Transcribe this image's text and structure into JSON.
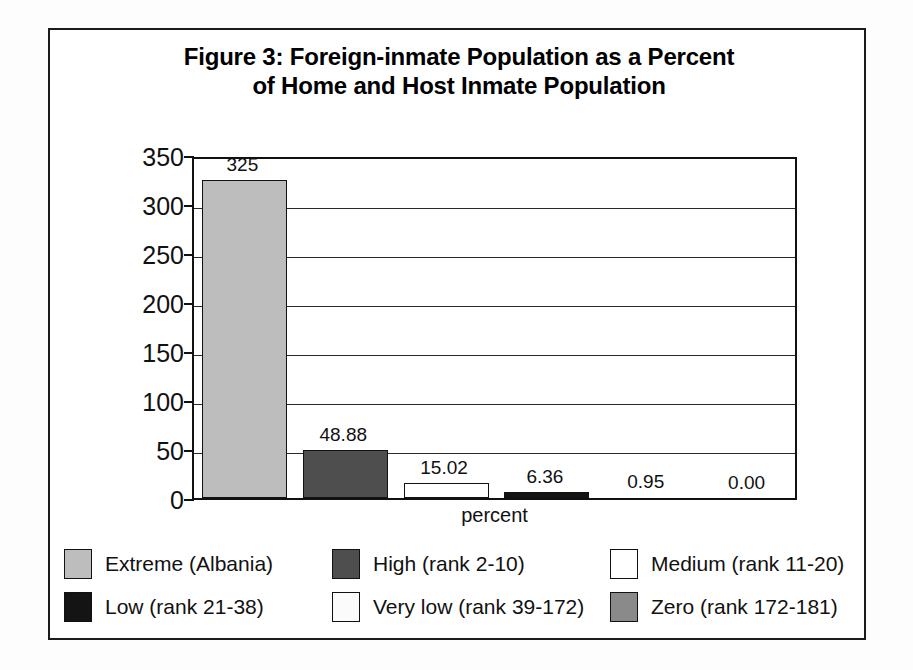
{
  "figure": {
    "title_line1": "Figure 3: Foreign-inmate Population as a Percent",
    "title_line2": "of Home and Host Inmate Population",
    "border_color": "#1b1b1b"
  },
  "chart_data": {
    "type": "bar",
    "title": "Figure 3: Foreign-inmate Population as a Percent of Home and Host Inmate Population",
    "xlabel": "percent",
    "ylabel": "",
    "ylim": [
      0,
      350
    ],
    "yticks": [
      0,
      50,
      100,
      150,
      200,
      250,
      300,
      350
    ],
    "grid": true,
    "legend_position": "bottom",
    "categories": [
      "Extreme (Albania)",
      "High (rank 2-10)",
      "Medium (rank 11-20)",
      "Low (rank 21-38)",
      "Very low (rank 39-172)",
      "Zero (rank 172-181)"
    ],
    "values": [
      325,
      48.88,
      15.02,
      6.36,
      0.95,
      0.0
    ],
    "data_labels": [
      "325",
      "48.88",
      "15.02",
      "6.36",
      "0.95",
      "0.00"
    ],
    "colors": [
      "#bdbdbd",
      "#4e4e4e",
      "#ffffff",
      "#141414",
      "#fbfbfb",
      "#8a8a8a"
    ]
  },
  "yticks": [
    {
      "label": "350",
      "value": 350
    },
    {
      "label": "300",
      "value": 300
    },
    {
      "label": "250",
      "value": 250
    },
    {
      "label": "200",
      "value": 200
    },
    {
      "label": "150",
      "value": 150
    },
    {
      "label": "100",
      "value": 100
    },
    {
      "label": "50",
      "value": 50
    },
    {
      "label": "0",
      "value": 0
    }
  ],
  "axis": {
    "x_label": "percent"
  },
  "bars": [
    {
      "label": "325",
      "value": 325,
      "series": "Extreme (Albania)"
    },
    {
      "label": "48.88",
      "value": 48.88,
      "series": "High (rank 2-10)"
    },
    {
      "label": "15.02",
      "value": 15.02,
      "series": "Medium (rank 11-20)"
    },
    {
      "label": "6.36",
      "value": 6.36,
      "series": "Low (rank 21-38)"
    },
    {
      "label": "0.95",
      "value": 0.95,
      "series": "Very low (rank 39-172)"
    },
    {
      "label": "0.00",
      "value": 0.0,
      "series": "Zero (rank 172-181)"
    }
  ],
  "legend": {
    "items": [
      {
        "label": "Extreme (Albania)",
        "color": "#bdbdbd",
        "pattern": "light-gray"
      },
      {
        "label": "High (rank 2-10)",
        "color": "#4e4e4e",
        "pattern": "dark-gray"
      },
      {
        "label": "Medium (rank 11-20)",
        "color": "#ffffff",
        "pattern": "white"
      },
      {
        "label": "Low (rank 21-38)",
        "color": "#141414",
        "pattern": "black"
      },
      {
        "label": "Very low (rank 39-172)",
        "color": "#fbfbfb",
        "pattern": "speckled-white"
      },
      {
        "label": "Zero (rank 172-181)",
        "color": "#8a8a8a",
        "pattern": "speckled-gray"
      }
    ]
  }
}
